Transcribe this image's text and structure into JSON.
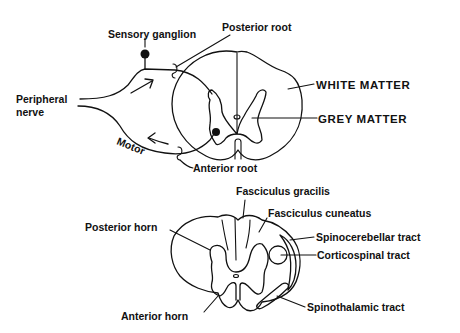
{
  "top_figure": {
    "title": "Spinal cord with spinal nerve roots",
    "labels": {
      "sensory_ganglion": "Sensory  ganglion",
      "posterior_root": "Posterior root",
      "peripheral_nerve_line1": "Peripheral",
      "peripheral_nerve_line2": "nerve",
      "white_matter": "WHITE MATTER",
      "grey_matter": "GREY  MATTER",
      "motor": "Motor",
      "anterior_root": "Anterior root"
    }
  },
  "bottom_figure": {
    "title": "Spinal cord cross-section tracts",
    "labels": {
      "fasciculus_gracilis": "Fasciculus  gracilis",
      "fasciculus_cuneatus": "Fasciculus  cuneatus",
      "posterior_horn": "Posterior  horn",
      "spinocerebellar_tract": "Spinocerebellar  tract",
      "corticospinal_tract": "Corticospinal  tract",
      "spinothalamic_tract": "Spinothalamic  tract",
      "anterior_horn": "Anterior  horn"
    }
  },
  "colors": {
    "ink": "#111111",
    "background": "#ffffff"
  }
}
